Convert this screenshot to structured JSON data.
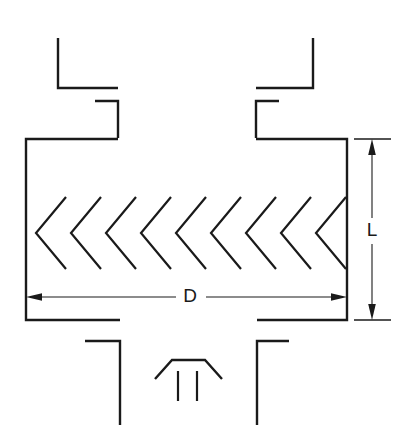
{
  "diagram": {
    "type": "engineering-line-drawing",
    "stroke_color": "#1a1a1a",
    "background_color": "#ffffff",
    "canvas": {
      "width": 408,
      "height": 445
    },
    "labels": {
      "diameter": {
        "text": "D",
        "x": 190,
        "y": 296,
        "meaning": "overall width dimension of the element"
      },
      "length": {
        "text": "L",
        "x": 372,
        "y": 231,
        "meaning": "overall height dimension of the element"
      }
    },
    "dimension_lines": {
      "horizontal": {
        "name": "D",
        "y": 297,
        "x_start": 26,
        "x_end": 347,
        "gap_start": 178,
        "gap_end": 205,
        "arrows": "both-ends-inward"
      },
      "vertical": {
        "name": "L",
        "x": 372,
        "y_start": 139,
        "y_end": 319,
        "gap_start": 218,
        "gap_end": 244,
        "arrows": "both-ends-inward",
        "witness_top_y": 139,
        "witness_bottom_y": 319,
        "witness_x_start": 354,
        "witness_x_end": 390
      }
    },
    "body": {
      "left_wall_x": 26,
      "right_wall_x": 347,
      "top_y": 139,
      "bottom_y": 319
    },
    "chevrons": {
      "count": 9,
      "direction": "pointing-left",
      "apex_x_start": 36,
      "pitch": 35,
      "half_height": 36,
      "arm_run": 30,
      "center_y": 233,
      "top_y": 197,
      "bottom_y": 269
    },
    "bottom_center_mark": {
      "flat_top_y": 360,
      "flat_x_start": 172,
      "flat_x_end": 205,
      "left_foot": {
        "x": 155,
        "y": 379
      },
      "right_foot": {
        "x": 222,
        "y": 379
      },
      "ticks": [
        {
          "x": 178,
          "y_start": 371,
          "y_end": 401
        },
        {
          "x": 197,
          "y_start": 371,
          "y_end": 401
        }
      ]
    },
    "ports": {
      "top_left": {
        "vertical_x": 58,
        "vertical_y_start": 38,
        "vertical_y_end": 88,
        "horizontal_y": 88,
        "horizontal_x_end": 118,
        "step_x": 95,
        "step_y": 101,
        "inner_x": 118,
        "inner_y": 139
      },
      "top_right": {
        "vertical_x": 313,
        "vertical_y_start": 38,
        "vertical_y_end": 88,
        "horizontal_y": 88,
        "horizontal_x_end": 256,
        "step_x": 279,
        "step_y": 101,
        "inner_x": 256,
        "inner_y": 139
      },
      "bottom_left": {
        "horizontal_y": 341,
        "horizontal_x_start": 85,
        "vertical_x": 120,
        "vertical_y_start": 341,
        "vertical_y_end": 425
      },
      "bottom_right": {
        "horizontal_y": 341,
        "horizontal_x_end": 289,
        "vertical_x": 257,
        "vertical_y_start": 341,
        "vertical_y_end": 425
      }
    }
  }
}
